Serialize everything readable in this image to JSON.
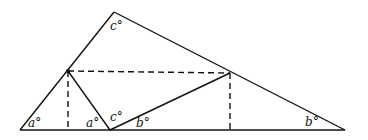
{
  "diagram": {
    "type": "geometry",
    "colors": {
      "stroke": "#111111",
      "background": "#ffffff"
    },
    "points": {
      "A": [
        20,
        130
      ],
      "T": [
        114,
        12
      ],
      "B": [
        345,
        130
      ],
      "P": [
        68,
        71
      ],
      "Q": [
        230,
        73
      ],
      "M": [
        110,
        130
      ],
      "P_foot": [
        68,
        130
      ],
      "Q_foot": [
        230,
        130
      ]
    },
    "solid_segments": [
      [
        "A",
        "B"
      ],
      [
        "A",
        "T"
      ],
      [
        "T",
        "B"
      ],
      [
        "P",
        "M"
      ],
      [
        "M",
        "Q"
      ]
    ],
    "dashed_segments": [
      [
        "P",
        "P_foot"
      ],
      [
        "Q",
        "Q_foot"
      ],
      [
        "P",
        "Q"
      ]
    ],
    "labels": [
      {
        "text": "a°",
        "x": 28,
        "y": 127,
        "name": "angle-a-left"
      },
      {
        "text": "a°",
        "x": 86,
        "y": 127,
        "name": "angle-a-middle"
      },
      {
        "text": "c°",
        "x": 110,
        "y": 121,
        "name": "angle-c-bottom"
      },
      {
        "text": "b°",
        "x": 136,
        "y": 127,
        "name": "angle-b-middle"
      },
      {
        "text": "c°",
        "x": 110,
        "y": 30,
        "name": "angle-c-top"
      },
      {
        "text": "b°",
        "x": 305,
        "y": 126,
        "name": "angle-b-right"
      }
    ]
  }
}
